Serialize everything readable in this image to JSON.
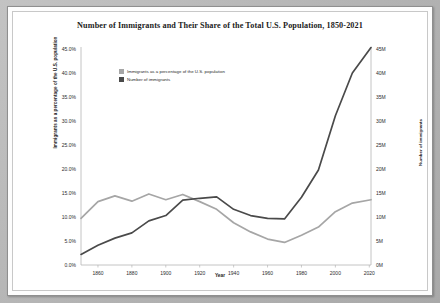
{
  "chart_data": {
    "type": "line",
    "title": "Number of Immigrants and Their Share of the Total U.S. Population, 1850-2021",
    "xlabel": "Year",
    "ylabel": "Immigrants as a percentage of the U.S. population",
    "y2label": "Number of immigrants",
    "grid": false,
    "legend_position": "top-left-inside",
    "xlim": [
      1850,
      2021
    ],
    "ylim": [
      0,
      45
    ],
    "y2lim": [
      0,
      45
    ],
    "xticks": [
      "1860",
      "1880",
      "1900",
      "1920",
      "1940",
      "1960",
      "1980",
      "2000",
      "2020"
    ],
    "xtick_values": [
      1860,
      1880,
      1900,
      1920,
      1940,
      1960,
      1980,
      2000,
      2020
    ],
    "yticks": [
      "0.0%",
      "5.0%",
      "10.0%",
      "15.0%",
      "20.0%",
      "25.0%",
      "30.0%",
      "35.0%",
      "40.0%",
      "45.0%"
    ],
    "ytick_values": [
      0,
      5,
      10,
      15,
      20,
      25,
      30,
      35,
      40,
      45
    ],
    "y2ticks": [
      "0M",
      "5M",
      "10M",
      "15M",
      "20M",
      "25M",
      "30M",
      "35M",
      "40M",
      "45M"
    ],
    "y2tick_values": [
      0,
      5,
      10,
      15,
      20,
      25,
      30,
      35,
      40,
      45
    ],
    "x": [
      1850,
      1860,
      1870,
      1880,
      1890,
      1900,
      1910,
      1920,
      1930,
      1940,
      1950,
      1960,
      1970,
      1980,
      1990,
      2000,
      2010,
      2021
    ],
    "series": [
      {
        "name": "Immigrants as a percentage of the U.S. population",
        "axis": "left",
        "unit": "percent",
        "color": "#a6a6a6",
        "values": [
          9.7,
          13.2,
          14.4,
          13.3,
          14.8,
          13.6,
          14.7,
          13.2,
          11.6,
          8.8,
          6.9,
          5.4,
          4.7,
          6.2,
          7.9,
          11.1,
          12.9,
          13.6
        ]
      },
      {
        "name": "Number of immigrants",
        "axis": "right",
        "unit": "millions",
        "color": "#4a4a4a",
        "values": [
          2.2,
          4.1,
          5.6,
          6.7,
          9.2,
          10.3,
          13.5,
          13.9,
          14.2,
          11.6,
          10.3,
          9.7,
          9.6,
          14.1,
          19.8,
          31.1,
          40.0,
          45.3
        ]
      }
    ]
  },
  "legend": {
    "items": [
      {
        "label": "Immigrants as a percentage of the U.S. population",
        "color": "#a6a6a6"
      },
      {
        "label": "Number of immigrants",
        "color": "#4a4a4a"
      }
    ]
  }
}
